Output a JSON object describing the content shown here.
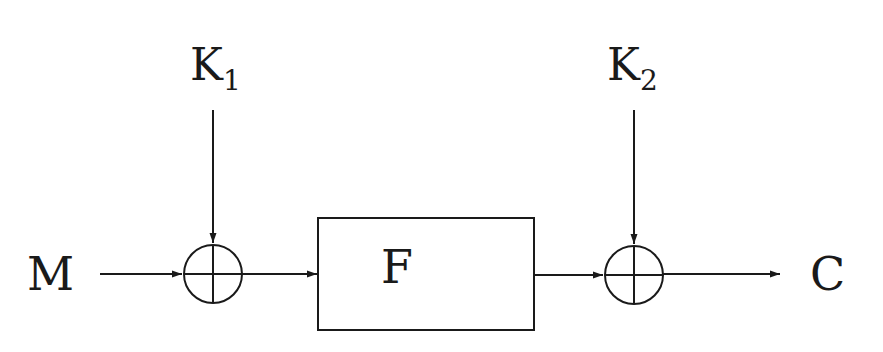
{
  "diagram": {
    "type": "block-cipher-whitening",
    "colors": {
      "stroke": "#1a1a1a",
      "background": "#ffffff"
    },
    "labels": {
      "input": "M",
      "output": "C",
      "key1": {
        "base": "K",
        "sub": "1"
      },
      "key2": {
        "base": "K",
        "sub": "2"
      },
      "function": "F"
    },
    "nodes": [
      {
        "id": "M",
        "kind": "text"
      },
      {
        "id": "xor1",
        "kind": "xor",
        "symbol": "⊕"
      },
      {
        "id": "F",
        "kind": "box"
      },
      {
        "id": "xor2",
        "kind": "xor",
        "symbol": "⊕"
      },
      {
        "id": "C",
        "kind": "text"
      },
      {
        "id": "K1",
        "kind": "text"
      },
      {
        "id": "K2",
        "kind": "text"
      }
    ],
    "edges": [
      {
        "from": "M",
        "to": "xor1"
      },
      {
        "from": "K1",
        "to": "xor1"
      },
      {
        "from": "xor1",
        "to": "F"
      },
      {
        "from": "F",
        "to": "xor2"
      },
      {
        "from": "K2",
        "to": "xor2"
      },
      {
        "from": "xor2",
        "to": "C"
      }
    ]
  }
}
